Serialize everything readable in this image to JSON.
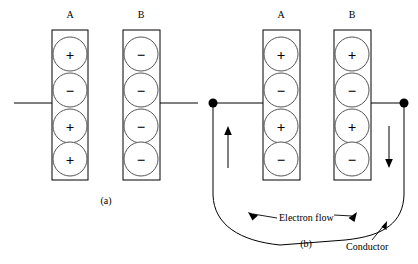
{
  "figure": {
    "title_absent": true,
    "panels": [
      {
        "id": "a",
        "caption": "(a)",
        "plates": [
          {
            "label": "A",
            "charges": [
              "+",
              "−",
              "+",
              "+"
            ]
          },
          {
            "label": "B",
            "charges": [
              "−",
              "−",
              "−",
              "−"
            ]
          }
        ],
        "leads": [
          "left-open-lead",
          "right-open-lead"
        ]
      },
      {
        "id": "b",
        "caption": "(b)",
        "plates": [
          {
            "label": "A",
            "charges": [
              "+",
              "−",
              "+",
              "−"
            ]
          },
          {
            "label": "B",
            "charges": [
              "+",
              "−",
              "+",
              "−"
            ]
          }
        ],
        "annotations": [
          {
            "name": "electron-flow",
            "text": "Electron flow"
          },
          {
            "name": "conductor",
            "text": "Conductor"
          }
        ],
        "arrows": [
          {
            "name": "left-wire-arrow",
            "direction": "up"
          },
          {
            "name": "right-wire-arrow",
            "direction": "down"
          }
        ],
        "nodes": [
          "left-terminal-node",
          "right-terminal-node"
        ]
      }
    ],
    "colors": {
      "stroke": "#000000",
      "circle_stroke": "#555555",
      "background": "#ffffff"
    }
  }
}
